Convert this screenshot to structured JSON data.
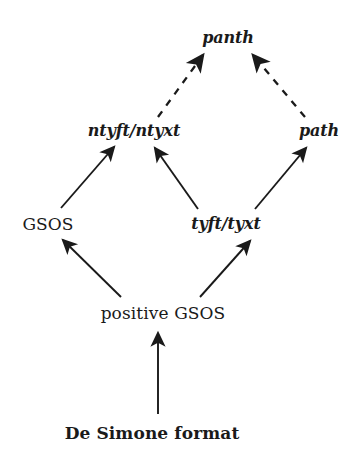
{
  "diagram": {
    "type": "hierarchy-lattice",
    "background_color": "#ffffff",
    "ink_color": "#1a1a1a",
    "nodes": [
      {
        "id": "panth",
        "label": "panth",
        "x": 228,
        "y": 38,
        "style": "bolditalic"
      },
      {
        "id": "ntyft_ntyxt",
        "label": "ntyft/ntyxt",
        "x": 134,
        "y": 131,
        "style": "bolditalic"
      },
      {
        "id": "path",
        "label": "path",
        "x": 319,
        "y": 131,
        "style": "bolditalic"
      },
      {
        "id": "gsos",
        "label": "GSOS",
        "x": 48,
        "y": 224,
        "style": "roman"
      },
      {
        "id": "tyft_tyxt",
        "label": "tyft/tyxt",
        "x": 226,
        "y": 224,
        "style": "bolditalic"
      },
      {
        "id": "positive_gsos",
        "label": "positive GSOS",
        "x": 163,
        "y": 313,
        "style": "roman"
      },
      {
        "id": "de_simone",
        "label": "De Simone format",
        "x": 152,
        "y": 433,
        "style": "boldroman"
      }
    ],
    "edges": [
      {
        "id": "ntyft-to-panth",
        "from": "ntyft_ntyxt",
        "to": "panth",
        "line": "dashed",
        "x1": 158,
        "y1": 117,
        "x2": 203,
        "y2": 55
      },
      {
        "id": "path-to-panth",
        "from": "path",
        "to": "panth",
        "line": "dashed",
        "x1": 305,
        "y1": 117,
        "x2": 253,
        "y2": 55
      },
      {
        "id": "gsos-to-ntyft",
        "from": "gsos",
        "to": "ntyft_ntyxt",
        "line": "solid",
        "x1": 61,
        "y1": 208,
        "x2": 114,
        "y2": 147
      },
      {
        "id": "tyft-to-ntyft",
        "from": "tyft_tyxt",
        "to": "ntyft_ntyxt",
        "line": "solid",
        "x1": 198,
        "y1": 209,
        "x2": 155,
        "y2": 148
      },
      {
        "id": "tyft-to-path",
        "from": "tyft_tyxt",
        "to": "path",
        "line": "solid",
        "x1": 255,
        "y1": 209,
        "x2": 306,
        "y2": 148
      },
      {
        "id": "posgsos-to-gsos",
        "from": "positive_gsos",
        "to": "gsos",
        "line": "solid",
        "x1": 121,
        "y1": 297,
        "x2": 63,
        "y2": 240
      },
      {
        "id": "posgsos-to-tyft",
        "from": "positive_gsos",
        "to": "tyft_tyxt",
        "line": "solid",
        "x1": 200,
        "y1": 297,
        "x2": 250,
        "y2": 241
      },
      {
        "id": "desimone-to-posgsos",
        "from": "de_simone",
        "to": "positive_gsos",
        "line": "solid",
        "x1": 158,
        "y1": 414,
        "x2": 158,
        "y2": 333
      }
    ]
  }
}
